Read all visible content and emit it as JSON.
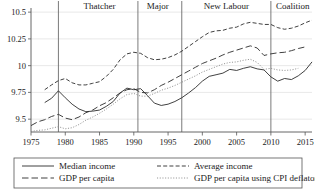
{
  "chart_data": {
    "type": "line",
    "title": "",
    "xlabel": "",
    "ylabel": "",
    "xlim": [
      1975,
      2016
    ],
    "ylim": [
      9.38,
      10.52
    ],
    "grid": true,
    "legend_position": "bottom",
    "y_ticks": [
      "9.5",
      "9.75",
      "10",
      "10.25",
      "10.5"
    ],
    "y_tick_values": [
      9.5,
      9.75,
      10,
      10.25,
      10.5
    ],
    "x_ticks": [
      "1975",
      "1980",
      "1985",
      "1990",
      "1995",
      "2000",
      "2005",
      "2010",
      "2015"
    ],
    "x_tick_values": [
      1975,
      1980,
      1985,
      1990,
      1995,
      2000,
      2005,
      2010,
      2015
    ],
    "annotations": [
      {
        "label": "Thatcher",
        "start_year": 1979,
        "end_year": 1990,
        "center_year": 1985
      },
      {
        "label": "Major",
        "start_year": 1990,
        "end_year": 1997,
        "center_year": 1993.5
      },
      {
        "label": "New Labour",
        "start_year": 1997,
        "end_year": 2010,
        "center_year": 2003.5
      },
      {
        "label": "Coalition",
        "start_year": 2010,
        "end_year": 2016,
        "center_year": 2013.2
      }
    ],
    "divider_years": [
      1979,
      1990.6,
      1997,
      2010
    ],
    "series": [
      {
        "name": "Median income",
        "style": "solid",
        "x": [
          1977,
          1978,
          1979,
          1980,
          1981,
          1982,
          1983,
          1984,
          1985,
          1986,
          1987,
          1988,
          1989,
          1990,
          1991,
          1992,
          1993,
          1994,
          1995,
          1996,
          1997,
          1998,
          1999,
          2000,
          2001,
          2002,
          2003,
          2004,
          2005,
          2006,
          2007,
          2008,
          2009,
          2010,
          2011,
          2012,
          2013,
          2014,
          2015,
          2016
        ],
        "values": [
          9.655,
          9.695,
          9.765,
          9.7,
          9.64,
          9.595,
          9.57,
          9.575,
          9.585,
          9.62,
          9.665,
          9.745,
          9.79,
          9.775,
          9.785,
          9.72,
          9.65,
          9.628,
          9.64,
          9.665,
          9.7,
          9.745,
          9.795,
          9.855,
          9.9,
          9.915,
          9.93,
          9.965,
          9.955,
          9.975,
          9.99,
          9.97,
          9.96,
          9.895,
          9.855,
          9.88,
          9.87,
          9.905,
          9.955,
          10.035
        ]
      },
      {
        "name": "Average income",
        "style": "dashed",
        "x": [
          1977,
          1978,
          1979,
          1980,
          1981,
          1982,
          1983,
          1984,
          1985,
          1986,
          1987,
          1988,
          1989,
          1990,
          1991,
          1992,
          1993,
          1994,
          1995,
          1996,
          1997,
          1998,
          1999,
          2000,
          2001,
          2002,
          2003,
          2004,
          2005,
          2006,
          2007,
          2008,
          2009,
          2010,
          2011,
          2012,
          2013,
          2014,
          2015,
          2016
        ],
        "values": [
          9.775,
          9.82,
          9.86,
          9.88,
          9.84,
          9.82,
          9.82,
          9.835,
          9.85,
          9.9,
          9.965,
          10.055,
          10.11,
          10.125,
          10.115,
          10.075,
          10.055,
          10.06,
          10.075,
          10.1,
          10.135,
          10.18,
          10.225,
          10.27,
          10.31,
          10.325,
          10.33,
          10.35,
          10.36,
          10.39,
          10.405,
          10.395,
          10.385,
          10.385,
          10.355,
          10.34,
          10.35,
          10.37,
          10.4,
          10.425
        ]
      },
      {
        "name": "GDP per capita",
        "style": "long-dashed",
        "x": [
          1975,
          1976,
          1977,
          1978,
          1979,
          1980,
          1981,
          1982,
          1983,
          1984,
          1985,
          1986,
          1987,
          1988,
          1989,
          1990,
          1991,
          1992,
          1993,
          1994,
          1995,
          1996,
          1997,
          1998,
          1999,
          2000,
          2001,
          2002,
          2003,
          2004,
          2005,
          2006,
          2007,
          2008,
          2009,
          2010,
          2011,
          2012,
          2013,
          2014,
          2015
        ],
        "values": [
          9.44,
          9.475,
          9.495,
          9.525,
          9.545,
          9.51,
          9.495,
          9.52,
          9.56,
          9.585,
          9.625,
          9.655,
          9.7,
          9.745,
          9.775,
          9.785,
          9.75,
          9.745,
          9.775,
          9.815,
          9.845,
          9.88,
          9.915,
          9.95,
          9.985,
          10.02,
          10.045,
          10.07,
          10.1,
          10.125,
          10.145,
          10.165,
          10.185,
          10.165,
          10.095,
          10.11,
          10.12,
          10.125,
          10.14,
          10.16,
          10.175
        ]
      },
      {
        "name": "GDP per capita using CPI deflator",
        "style": "dotted",
        "x": [
          1975,
          1976,
          1977,
          1978,
          1979,
          1980,
          1981,
          1982,
          1983,
          1984,
          1985,
          1986,
          1987,
          1988,
          1989,
          1990,
          1991,
          1992,
          1993,
          1994,
          1995,
          1996,
          1997,
          1998,
          1999,
          2000,
          2001,
          2002,
          2003,
          2004,
          2005,
          2006,
          2007,
          2008,
          2009,
          2010,
          2011,
          2012,
          2013,
          2014
        ],
        "values": [
          9.385,
          9.395,
          9.4,
          9.415,
          9.43,
          9.41,
          9.42,
          9.45,
          9.49,
          9.52,
          9.555,
          9.595,
          9.64,
          9.69,
          9.73,
          9.74,
          9.715,
          9.715,
          9.74,
          9.77,
          9.79,
          9.815,
          9.845,
          9.875,
          9.905,
          9.94,
          9.965,
          9.99,
          10.015,
          10.03,
          10.035,
          10.05,
          10.06,
          10.03,
          9.965,
          9.975,
          9.96,
          9.955,
          9.96,
          9.975
        ]
      }
    ],
    "legend": [
      {
        "label": "Median income",
        "style": "solid"
      },
      {
        "label": "Average income",
        "style": "dashed"
      },
      {
        "label": "GDP per capita",
        "style": "long-dashed"
      },
      {
        "label": "GDP per capita using CPI deflator",
        "style": "dotted"
      }
    ]
  }
}
